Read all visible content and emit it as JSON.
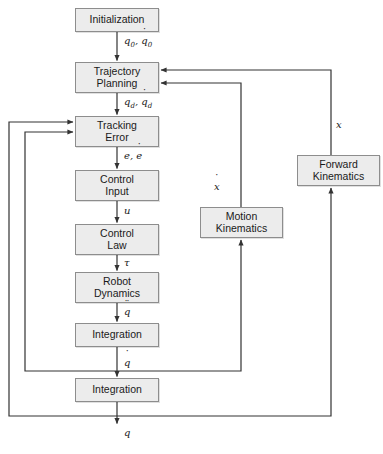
{
  "diagram": {
    "background_color": "#ffffff",
    "box_fill_color": "#ececec",
    "box_border_color": "#8d8d8d",
    "line_color": "#3a3a3a",
    "nodes": [
      {
        "id": "initialization",
        "label": "Initialization",
        "x": 75,
        "y": 8,
        "w": 84,
        "h": 24
      },
      {
        "id": "trajectory-planning",
        "label": "Trajectory\nPlanning",
        "x": 75,
        "y": 62,
        "w": 84,
        "h": 31
      },
      {
        "id": "tracking-error",
        "label": "Tracking\nError",
        "x": 75,
        "y": 116,
        "w": 84,
        "h": 31
      },
      {
        "id": "control-input",
        "label": "Control\nInput",
        "x": 75,
        "y": 170,
        "w": 84,
        "h": 31
      },
      {
        "id": "control-law",
        "label": "Control\nLaw",
        "x": 75,
        "y": 224,
        "w": 84,
        "h": 31
      },
      {
        "id": "robot-dynamics",
        "label": "Robot\nDynamics",
        "x": 75,
        "y": 272,
        "w": 84,
        "h": 31
      },
      {
        "id": "integration-1",
        "label": "Integration",
        "x": 75,
        "y": 323,
        "w": 84,
        "h": 24
      },
      {
        "id": "integration-2",
        "label": "Integration",
        "x": 75,
        "y": 378,
        "w": 84,
        "h": 24
      },
      {
        "id": "motion-kinematics",
        "label": "Motion\nKinematics",
        "x": 200,
        "y": 207,
        "w": 83,
        "h": 31
      },
      {
        "id": "forward-kinematics",
        "label": "Forward\nKinematics",
        "x": 297,
        "y": 155,
        "w": 83,
        "h": 31
      }
    ],
    "edge_labels": [
      {
        "id": "label-q0",
        "text": "q0, q0dot",
        "x": 112,
        "y": 40,
        "kind": "q0"
      },
      {
        "id": "label-qd",
        "text": "qd, qddot",
        "x": 112,
        "y": 101,
        "kind": "qd"
      },
      {
        "id": "label-e",
        "text": "e, edot",
        "x": 112,
        "y": 155,
        "kind": "e"
      },
      {
        "id": "label-u",
        "text": "u",
        "x": 118,
        "y": 210,
        "kind": "u"
      },
      {
        "id": "label-tau",
        "text": "τ",
        "x": 117,
        "y": 262,
        "kind": "tau"
      },
      {
        "id": "label-qddot",
        "text": "qddotdot",
        "x": 117,
        "y": 310,
        "kind": "qddd"
      },
      {
        "id": "label-qdot",
        "text": "qdot",
        "x": 117,
        "y": 362,
        "kind": "qdot"
      },
      {
        "id": "label-q-out",
        "text": "q",
        "x": 117,
        "y": 432,
        "kind": "q"
      },
      {
        "id": "label-xdot",
        "text": "xdot",
        "x": 214,
        "y": 186,
        "kind": "xdot"
      },
      {
        "id": "label-x",
        "text": "x",
        "x": 336,
        "y": 124,
        "kind": "x"
      }
    ],
    "paths": [
      {
        "id": "edge-init-to-trajectory",
        "from": "initialization",
        "to": "trajectory-planning"
      },
      {
        "id": "edge-trajectory-to-tracking",
        "from": "trajectory-planning",
        "to": "tracking-error"
      },
      {
        "id": "edge-tracking-to-control-input",
        "from": "tracking-error",
        "to": "control-input"
      },
      {
        "id": "edge-control-input-to-control-law",
        "from": "control-input",
        "to": "control-law"
      },
      {
        "id": "edge-control-law-to-robot-dynamics",
        "from": "control-law",
        "to": "robot-dynamics"
      },
      {
        "id": "edge-robot-dynamics-to-integration1",
        "from": "robot-dynamics",
        "to": "integration-1"
      },
      {
        "id": "edge-integration1-to-integration2",
        "from": "integration-1",
        "to": "integration-2"
      },
      {
        "id": "edge-integration2-output",
        "from": "integration-2",
        "to": "output-q"
      },
      {
        "id": "edge-qdot-feedback-tracking",
        "from": "integration-1",
        "to": "tracking-error"
      },
      {
        "id": "edge-q-feedback-tracking",
        "from": "integration-2",
        "to": "tracking-error"
      },
      {
        "id": "edge-qdot-to-motion-kinematics",
        "from": "integration-1",
        "to": "motion-kinematics"
      },
      {
        "id": "edge-q-to-forward-kinematics",
        "from": "integration-2",
        "to": "forward-kinematics"
      },
      {
        "id": "edge-motion-kinematics-to-trajectory",
        "from": "motion-kinematics",
        "to": "trajectory-planning"
      },
      {
        "id": "edge-forward-kinematics-to-trajectory",
        "from": "forward-kinematics",
        "to": "trajectory-planning"
      }
    ]
  }
}
